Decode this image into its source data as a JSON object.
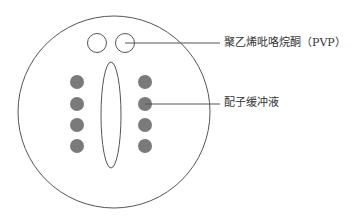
{
  "diagram": {
    "type": "agarose-gel-well-plate-schematic",
    "labels": {
      "pvp": "聚乙烯吡咯烷酮（PVP）",
      "buffer": "配子缓冲液"
    },
    "colors": {
      "stroke": "#555555",
      "dot_fill": "#7a7a7a",
      "background": "#ffffff",
      "text": "#333333"
    },
    "components": {
      "outer_dish": "large-circle",
      "pvp_drops": 2,
      "central_drop": "vertical-ellipse",
      "buffer_drops_left": 4,
      "buffer_drops_right": 4
    }
  }
}
